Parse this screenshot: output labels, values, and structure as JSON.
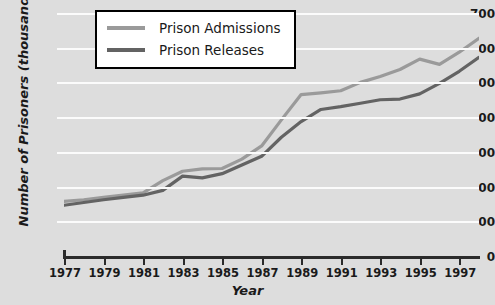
{
  "chart_data": {
    "type": "line",
    "title": "",
    "xlabel": "Year",
    "ylabel": "Number of Prisoners (thousands)",
    "xlim": [
      1977,
      1998
    ],
    "ylim": [
      0,
      700
    ],
    "y_ticks": [
      0,
      100,
      200,
      300,
      400,
      500,
      600,
      700
    ],
    "x_ticks": [
      1977,
      1979,
      1981,
      1983,
      1985,
      1987,
      1989,
      1991,
      1993,
      1995,
      1997
    ],
    "grid": "horizontal",
    "legend_position": "top-center",
    "x": [
      1977,
      1978,
      1979,
      1980,
      1981,
      1982,
      1983,
      1984,
      1985,
      1986,
      1987,
      1988,
      1989,
      1990,
      1991,
      1992,
      1993,
      1994,
      1995,
      1996,
      1997,
      1998
    ],
    "series": [
      {
        "name": "Prison Admissions",
        "color": "#9a9a9a",
        "values": [
          160,
          165,
          172,
          178,
          185,
          220,
          247,
          254,
          255,
          282,
          320,
          395,
          468,
          473,
          479,
          503,
          520,
          540,
          570,
          555,
          590,
          630
        ]
      },
      {
        "name": "Prison Releases",
        "color": "#636363",
        "values": [
          149,
          157,
          165,
          172,
          178,
          192,
          233,
          228,
          240,
          265,
          290,
          345,
          390,
          425,
          433,
          443,
          453,
          455,
          470,
          500,
          535,
          575
        ]
      }
    ]
  },
  "legend": {
    "items": [
      {
        "label": "Prison Admissions",
        "color": "#9a9a9a"
      },
      {
        "label": "Prison Releases",
        "color": "#636363"
      }
    ]
  }
}
